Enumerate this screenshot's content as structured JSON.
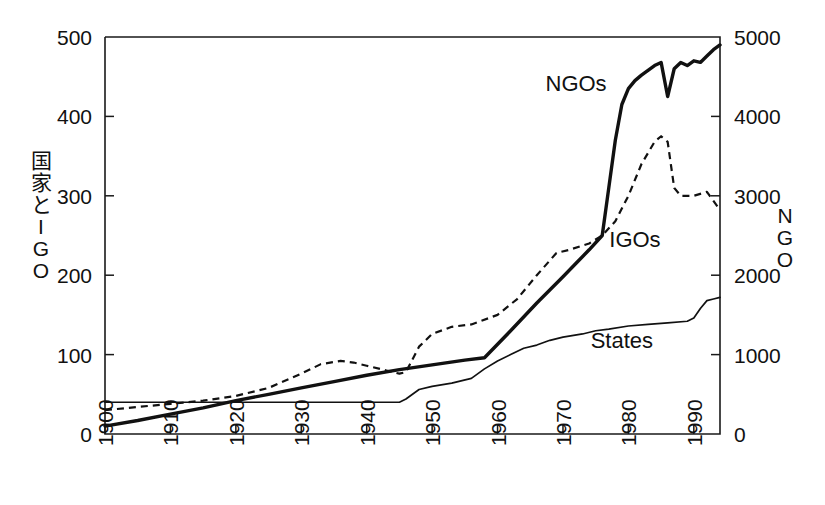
{
  "chart_data": {
    "type": "line",
    "title": "",
    "subtitle": "",
    "xlabel": "",
    "ylabel": "国家とIGO",
    "ylabel_right": "NGO",
    "grid": false,
    "legend": "inline-annotations",
    "xlim": [
      1900,
      1994
    ],
    "xticks": [
      1900,
      1910,
      1920,
      1930,
      1940,
      1950,
      1960,
      1970,
      1980,
      1990
    ],
    "xticklabels": [
      "1900",
      "1910",
      "1920",
      "1930",
      "1940",
      "1950",
      "1960",
      "1970",
      "1980",
      "1990"
    ],
    "ylim_left": [
      0,
      500
    ],
    "yticks_left": [
      0,
      100,
      200,
      300,
      400,
      500
    ],
    "yticklabels_left": [
      "0",
      "100",
      "200",
      "300",
      "400",
      "500"
    ],
    "ylim_right": [
      0,
      5000
    ],
    "yticks_right": [
      0,
      1000,
      2000,
      3000,
      4000,
      5000
    ],
    "yticklabels_right": [
      "0",
      "1000",
      "2000",
      "3000",
      "4000",
      "5000"
    ],
    "series": [
      {
        "name": "NGOs",
        "axis": "right",
        "style": "thick-solid",
        "label_x": 1972,
        "label_y": 4320,
        "x": [
          1900,
          1905,
          1910,
          1915,
          1920,
          1925,
          1930,
          1935,
          1940,
          1945,
          1950,
          1955,
          1958,
          1962,
          1966,
          1970,
          1972,
          1974,
          1976,
          1977,
          1978,
          1979,
          1980,
          1981,
          1982,
          1983,
          1984,
          1985,
          1986,
          1987,
          1988,
          1989,
          1990,
          1991,
          1992,
          1993,
          1994
        ],
        "y": [
          100,
          170,
          250,
          330,
          420,
          500,
          580,
          660,
          740,
          810,
          870,
          930,
          960,
          1300,
          1650,
          1980,
          2150,
          2320,
          2500,
          3100,
          3700,
          4150,
          4350,
          4450,
          4520,
          4580,
          4640,
          4680,
          4250,
          4600,
          4680,
          4640,
          4700,
          4680,
          4760,
          4840,
          4900
        ]
      },
      {
        "name": "IGOs",
        "axis": "left",
        "style": "dashed",
        "label_x": 1981,
        "label_y": 235,
        "x": [
          1900,
          1905,
          1910,
          1915,
          1920,
          1925,
          1930,
          1933,
          1936,
          1938,
          1940,
          1943,
          1945,
          1946,
          1948,
          1950,
          1953,
          1956,
          1960,
          1963,
          1966,
          1969,
          1971,
          1974,
          1976,
          1978,
          1980,
          1982,
          1984,
          1985,
          1986,
          1987,
          1988,
          1990,
          1992,
          1994
        ],
        "y": [
          30,
          34,
          38,
          42,
          48,
          58,
          76,
          88,
          92,
          90,
          86,
          80,
          76,
          78,
          110,
          126,
          135,
          138,
          150,
          170,
          200,
          228,
          232,
          240,
          250,
          268,
          300,
          340,
          368,
          375,
          368,
          310,
          300,
          300,
          305,
          282
        ]
      },
      {
        "name": "States",
        "axis": "left",
        "style": "thin-solid",
        "label_x": 1979,
        "label_y": 108,
        "x": [
          1900,
          1910,
          1920,
          1930,
          1940,
          1944,
          1945,
          1946,
          1948,
          1950,
          1953,
          1956,
          1958,
          1960,
          1962,
          1964,
          1966,
          1968,
          1970,
          1973,
          1975,
          1977,
          1980,
          1983,
          1986,
          1989,
          1990,
          1991,
          1992,
          1993,
          1994
        ],
        "y": [
          40,
          40,
          40,
          40,
          40,
          40,
          40,
          44,
          56,
          60,
          64,
          70,
          82,
          92,
          100,
          108,
          112,
          118,
          122,
          126,
          130,
          132,
          136,
          138,
          140,
          142,
          146,
          158,
          168,
          170,
          172
        ]
      }
    ],
    "annotations": [
      {
        "text": "NGOs",
        "x": 1972,
        "y_right": 4320
      },
      {
        "text": "IGOs",
        "x": 1981,
        "y_left": 235
      },
      {
        "text": "States",
        "x": 1979,
        "y_left": 108
      }
    ]
  },
  "axes": {
    "left_label_chars": [
      "国",
      "家",
      "と",
      "I",
      "G",
      "O"
    ],
    "right_label_chars": [
      "N",
      "G",
      "O"
    ]
  }
}
